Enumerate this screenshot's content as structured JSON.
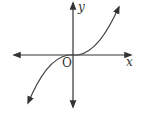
{
  "diagram": {
    "type": "function-graph",
    "axes": {
      "x_label": "x",
      "y_label": "y",
      "origin_label": "O"
    },
    "curve": {
      "shape": "cubic",
      "passes_through": "origin",
      "inflection_at_origin": true
    }
  }
}
